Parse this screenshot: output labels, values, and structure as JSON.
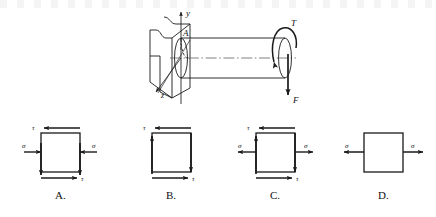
{
  "figure": {
    "main_diagram": {
      "name": "shaft-in-wall-diagram",
      "axis_labels": {
        "y_axis": "y",
        "z_axis": "z"
      },
      "point_label": "A",
      "torque_label": "T",
      "force_label": "F",
      "wall_label": "",
      "elements": [
        "wall-block",
        "circular-shaft",
        "shaft-centerline",
        "cross-section-ellipse",
        "torque-arrow",
        "force-arrow",
        "y-axis-arrow",
        "z-axis-arrow"
      ]
    },
    "options": [
      {
        "id": "A",
        "label": "A.",
        "normal_stress_symbol": "σ",
        "shear_stress_symbol": "τ",
        "has_normal_stress": true,
        "normal_stress_direction": "inward-compression",
        "has_vertical_shear_arrows": true,
        "vertical_left_direction": "down",
        "vertical_right_direction": "down",
        "top_shear_direction": "left",
        "bottom_shear_direction": "right",
        "top_shear_label": "τ",
        "bottom_shear_label": "τ",
        "left_normal_label": "σ",
        "right_normal_label": "σ"
      },
      {
        "id": "B",
        "label": "B.",
        "normal_stress_symbol": "",
        "shear_stress_symbol": "τ",
        "has_normal_stress": false,
        "normal_stress_direction": "none",
        "has_vertical_shear_arrows": true,
        "vertical_left_direction": "up",
        "vertical_right_direction": "down",
        "top_shear_direction": "left",
        "bottom_shear_direction": "right",
        "top_shear_label": "τ",
        "bottom_shear_label": "τ",
        "left_normal_label": "",
        "right_normal_label": ""
      },
      {
        "id": "C",
        "label": "C.",
        "normal_stress_symbol": "σ",
        "shear_stress_symbol": "τ",
        "has_normal_stress": true,
        "normal_stress_direction": "outward-tension",
        "has_vertical_shear_arrows": true,
        "vertical_left_direction": "up",
        "vertical_right_direction": "down",
        "top_shear_direction": "left",
        "bottom_shear_direction": "right",
        "top_shear_label": "τ",
        "bottom_shear_label": "τ",
        "left_normal_label": "σ",
        "right_normal_label": "σ"
      },
      {
        "id": "D",
        "label": "D.",
        "normal_stress_symbol": "σ",
        "shear_stress_symbol": "",
        "has_normal_stress": true,
        "normal_stress_direction": "outward-tension",
        "has_vertical_shear_arrows": false,
        "vertical_left_direction": "none",
        "vertical_right_direction": "none",
        "top_shear_direction": "none",
        "bottom_shear_direction": "none",
        "top_shear_label": "",
        "bottom_shear_label": "",
        "left_normal_label": "σ",
        "right_normal_label": "σ"
      }
    ]
  },
  "colors": {
    "line": "#1a1a1a",
    "background": "#ffffff",
    "centerline": "#555555"
  }
}
